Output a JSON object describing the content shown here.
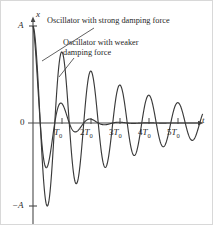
{
  "figure": {
    "axes": {
      "y_axis_label": "x",
      "x_axis_label": "t",
      "origin_label": "0",
      "amplitude_top_label": "A",
      "amplitude_bottom_label": "−A"
    },
    "tick_labels": [
      {
        "text": "T",
        "sub": "0",
        "prefix": ""
      },
      {
        "text": "T",
        "sub": "0",
        "prefix": "2"
      },
      {
        "text": "T",
        "sub": "0",
        "prefix": "3"
      },
      {
        "text": "T",
        "sub": "0",
        "prefix": "4"
      },
      {
        "text": "T",
        "sub": "0",
        "prefix": "5"
      }
    ],
    "annotations": {
      "strong": "Oscillator with strong damping force",
      "weaker_line1": "Oscillator with weaker",
      "weaker_line2": "damping force"
    },
    "colors": {
      "curve": "#3a3a3a",
      "axis": "#4a4a4a",
      "text": "#222222",
      "background": "#ffffff",
      "frame": "#d8d8d8"
    }
  },
  "chart_data": {
    "type": "line",
    "title": "",
    "xlabel": "t",
    "ylabel": "x",
    "xlim": [
      0,
      6.2
    ],
    "ylim": [
      -1.05,
      1.05
    ],
    "grid": false,
    "legend": "inline-annotations",
    "x_tick_values": [
      1,
      2,
      3,
      4,
      5
    ],
    "x_tick_text": [
      "T₀",
      "2T₀",
      "3T₀",
      "4T₀",
      "5T₀"
    ],
    "y_tick_values": [
      1,
      0,
      -1
    ],
    "y_tick_text": [
      "A",
      "0",
      "−A"
    ],
    "series": [
      {
        "name": "Oscillator with strong damping force",
        "model": "A*exp(-t/tau)*cos(2*pi*t/T0)",
        "tau_in_periods": 0.62,
        "amplitude_envelope": [
          {
            "t": 0.0,
            "x": 1.0
          },
          {
            "t": 0.5,
            "x": -0.45
          },
          {
            "t": 1.0,
            "x": 0.2
          },
          {
            "t": 1.5,
            "x": -0.09
          },
          {
            "t": 2.0,
            "x": 0.04
          },
          {
            "t": 2.5,
            "x": -0.018
          },
          {
            "t": 3.0,
            "x": 0.008
          },
          {
            "t": 3.5,
            "x": -0.004
          },
          {
            "t": 4.0,
            "x": 0.002
          }
        ]
      },
      {
        "name": "Oscillator with weaker damping force",
        "model": "A*exp(-t/tau)*cos(2*pi*t/T0)",
        "tau_in_periods": 3.2,
        "amplitude_envelope": [
          {
            "t": 0.0,
            "x": 1.0
          },
          {
            "t": 0.5,
            "x": -0.85
          },
          {
            "t": 1.0,
            "x": 0.73
          },
          {
            "t": 1.5,
            "x": -0.63
          },
          {
            "t": 2.0,
            "x": 0.54
          },
          {
            "t": 2.5,
            "x": -0.47
          },
          {
            "t": 3.0,
            "x": 0.4
          },
          {
            "t": 3.5,
            "x": -0.35
          },
          {
            "t": 4.0,
            "x": 0.3
          },
          {
            "t": 4.5,
            "x": -0.26
          },
          {
            "t": 5.0,
            "x": 0.22
          },
          {
            "t": 5.5,
            "x": -0.19
          },
          {
            "t": 6.0,
            "x": 0.16
          }
        ]
      }
    ]
  }
}
